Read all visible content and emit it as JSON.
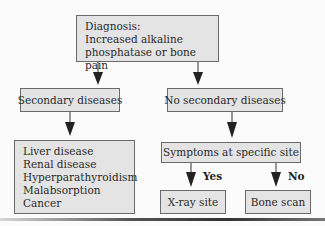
{
  "diagram": {
    "root": {
      "lines": [
        "Diagnosis:",
        "Increased alkaline",
        "phosphatase or bone pain"
      ]
    },
    "left_branch": {
      "label": "Secondary diseases",
      "child": {
        "lines": [
          "Liver disease",
          "Renal disease",
          "Hyperparathyroidism",
          "Malabsorption",
          "Cancer"
        ]
      }
    },
    "right_branch": {
      "label": "No secondary diseases",
      "child": {
        "label": "Symptoms at specific site",
        "yes": {
          "edge_label": "Yes",
          "label": "X-ray site"
        },
        "no": {
          "edge_label": "No",
          "label": "Bone scan"
        }
      }
    }
  },
  "colors": {
    "box_fill": "#e4e4e4",
    "box_border": "#6a6a6a",
    "arrow": "#222222"
  }
}
